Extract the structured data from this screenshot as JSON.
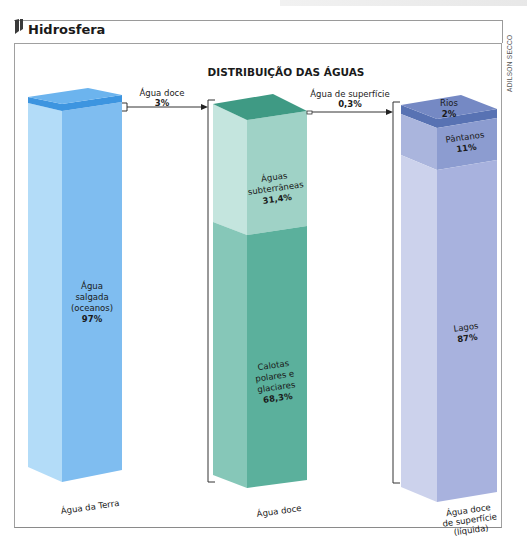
{
  "header": {
    "title": "Hidrosfera",
    "icon": "section-marker-icon"
  },
  "credit": "ADILSON SECCO",
  "diagram": {
    "title": "DISTRIBUIÇÃO DAS ÁGUAS",
    "colors": {
      "salt_front": "#7fbdf0",
      "salt_side": "#b3dcf8",
      "salt_top": "#6cb4ee",
      "fresh_band": "#3d95e0",
      "ground_front": "#9fd2c6",
      "ground_side": "#c4e5de",
      "ice_front": "#5bb09c",
      "ice_side": "#86c7b8",
      "green_top": "#3f9a84",
      "rivers_front": "#5872b3",
      "rivers_top": "#7589c4",
      "swamp_front": "#8c9cd0",
      "swamp_side": "#aab5dd",
      "lakes_front": "#a8b2de",
      "lakes_side": "#ccd2ec"
    },
    "columns": [
      {
        "id": "earth",
        "label": "Água da Terra",
        "segments": [
          {
            "name": "Água doce",
            "value": 3,
            "text": ""
          },
          {
            "name": "Água salgada (oceanos)",
            "value": 97,
            "lines": [
              "Água",
              "salgada",
              "(oceanos)"
            ],
            "pct": "97%"
          }
        ]
      },
      {
        "id": "fresh",
        "label": "Água doce",
        "segments": [
          {
            "name": "Água de superfície",
            "value": 0.3
          },
          {
            "name": "Águas subterrâneas",
            "value": 31.4,
            "lines": [
              "Águas",
              "subterrâneas"
            ],
            "pct": "31,4%"
          },
          {
            "name": "Calotas polares e glaciares",
            "value": 68.3,
            "lines": [
              "Calotas",
              "polares e",
              "glaciares"
            ],
            "pct": "68,3%"
          }
        ]
      },
      {
        "id": "surface",
        "label_lines": [
          "Água doce",
          "de superfície",
          "(líquida)"
        ],
        "segments": [
          {
            "name": "Rios",
            "value": 2,
            "lines": [
              "Rios"
            ],
            "pct": "2%"
          },
          {
            "name": "Pântanos",
            "value": 11,
            "lines": [
              "Pântanos"
            ],
            "pct": "11%"
          },
          {
            "name": "Lagos",
            "value": 87,
            "lines": [
              "Lagos"
            ],
            "pct": "87%"
          }
        ]
      }
    ],
    "connectors": [
      {
        "from": "earth",
        "to": "fresh",
        "label": "Água doce",
        "pct": "3%"
      },
      {
        "from": "fresh",
        "to": "surface",
        "label": "Água de superfície",
        "pct": "0,3%"
      }
    ]
  }
}
